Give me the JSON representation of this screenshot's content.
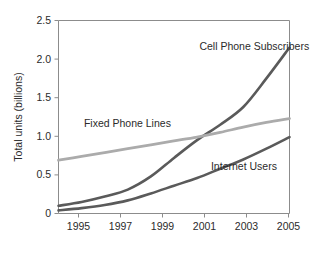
{
  "chart_data": {
    "type": "line",
    "title": "",
    "xlabel": "",
    "ylabel": "Total units (billions)",
    "xlim": [
      1995,
      2005
    ],
    "ylim": [
      0,
      2.5
    ],
    "grid": false,
    "legend_position": "inline-annotations",
    "x": [
      1995,
      1996,
      1997,
      1998,
      1999,
      2000,
      2001,
      2002,
      2003,
      2004,
      2005
    ],
    "xticks": [
      "1995",
      "1997",
      "1999",
      "2001",
      "2003",
      "2005"
    ],
    "xtick_values": [
      1995,
      1997,
      1999,
      2001,
      2003,
      2005
    ],
    "yticks": [
      "0",
      "0.5",
      "1.0",
      "1.5",
      "2.0",
      "2.5"
    ],
    "ytick_values": [
      0,
      0.5,
      1.0,
      1.5,
      2.0,
      2.5
    ],
    "series": [
      {
        "name": "Cell Phone Subscribers",
        "color": "#5a5a5a",
        "width": 2.6,
        "values": [
          0.1,
          0.15,
          0.22,
          0.31,
          0.48,
          0.72,
          0.95,
          1.15,
          1.38,
          1.75,
          2.15
        ],
        "label_x": 2001.1,
        "label_y": 2.12
      },
      {
        "name": "Fixed Phone Lines",
        "color": "#ababab",
        "width": 2.8,
        "values": [
          0.69,
          0.74,
          0.79,
          0.84,
          0.89,
          0.94,
          0.99,
          1.05,
          1.12,
          1.18,
          1.23
        ],
        "label_x": 1996.1,
        "label_y": 1.12
      },
      {
        "name": "Internet Users",
        "color": "#5a5a5a",
        "width": 2.6,
        "values": [
          0.04,
          0.07,
          0.11,
          0.17,
          0.26,
          0.36,
          0.46,
          0.58,
          0.7,
          0.84,
          0.99
        ],
        "label_x": 2001.6,
        "label_y": 0.56
      }
    ]
  },
  "axis": {
    "y_title": "Total units (billions)",
    "y_tick_labels": [
      "2.5",
      "2.0",
      "1.5",
      "1.0",
      "0.5",
      "0"
    ],
    "x_tick_labels": [
      "1995",
      "1997",
      "1999",
      "2001",
      "2003",
      "2005"
    ]
  },
  "annotations": [
    {
      "text": "Cell Phone Subscribers"
    },
    {
      "text": "Fixed Phone Lines"
    },
    {
      "text": "Internet Users"
    }
  ],
  "colors": {
    "frame": "#8c8c8c",
    "text": "#2b2b2b",
    "dark_series": "#5a5a5a",
    "light_series": "#ababab",
    "background": "#ffffff"
  }
}
